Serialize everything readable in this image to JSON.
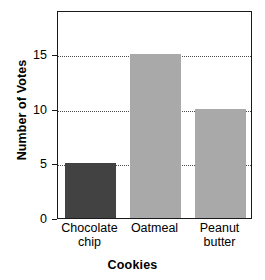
{
  "chart_data": {
    "type": "bar",
    "title": "",
    "xlabel": "Cookies",
    "ylabel": "Number of Votes",
    "categories": [
      "Chocolate chip",
      "Oatmeal",
      "Peanut butter"
    ],
    "category_lines": [
      [
        "Chocolate",
        "chip"
      ],
      [
        "Oatmeal"
      ],
      [
        "Peanut",
        "butter"
      ]
    ],
    "values": [
      5,
      15,
      10
    ],
    "ylim": [
      0,
      19
    ],
    "yticks": [
      0,
      5,
      10,
      15
    ],
    "ytick_labels": [
      "0",
      "5",
      "10",
      "15"
    ],
    "grid": true,
    "grid_style": "dotted",
    "legend": "none",
    "bar_colors": [
      "#424242",
      "#a9a9a9",
      "#a9a9a9"
    ],
    "axis_color": "#1a1a1a",
    "grid_color": "#4a4a4a",
    "background": "#ffffff"
  }
}
